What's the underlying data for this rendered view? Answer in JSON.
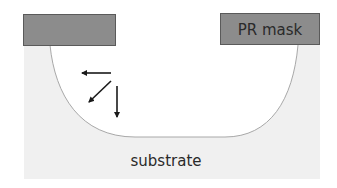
{
  "diagram": {
    "type": "cross-section",
    "labels": {
      "mask": "PR mask",
      "substrate": "substrate"
    },
    "colors": {
      "background": "#ffffff",
      "substrate_fill": "#f0f0f0",
      "trench_fill": "#ffffff",
      "trench_outline": "#a8a8a8",
      "mask_fill": "#8c8c8c",
      "mask_border": "#5a5a5a",
      "arrow": "#1a1a1a",
      "text": "#2a2a2a"
    },
    "arrows": [
      {
        "name": "lateral-etch-arrow",
        "direction": "left"
      },
      {
        "name": "diagonal-etch-arrow",
        "direction": "down-left"
      },
      {
        "name": "vertical-etch-arrow",
        "direction": "down"
      }
    ]
  }
}
